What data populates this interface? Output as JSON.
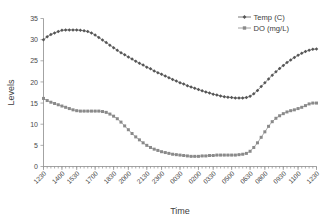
{
  "chart_data": {
    "type": "line",
    "title": "",
    "xlabel": "Time",
    "ylabel": "Levels",
    "ylim": [
      0,
      35
    ],
    "ytick_step": 5,
    "yticks": [
      0,
      5,
      10,
      15,
      20,
      25,
      30,
      35
    ],
    "grid": false,
    "legend_position": "top-right",
    "x_tick_labels": [
      "1230",
      "1400",
      "1530",
      "1700",
      "1830",
      "2000",
      "2130",
      "2300",
      "0030",
      "0200",
      "0330",
      "0500",
      "0630",
      "0800",
      "0930",
      "1100",
      "1230"
    ],
    "x_tick_interval_minutes": 90,
    "x_sample_interval_minutes": 15,
    "series": [
      {
        "name": "Temp (C)",
        "marker": "diamond",
        "color": "#555555",
        "values": [
          30.0,
          30.7,
          31.2,
          31.6,
          31.9,
          32.2,
          32.3,
          32.3,
          32.3,
          32.3,
          32.2,
          32.1,
          31.9,
          31.6,
          31.1,
          30.5,
          29.9,
          29.3,
          28.7,
          28.1,
          27.5,
          26.9,
          26.4,
          25.9,
          25.4,
          24.9,
          24.4,
          24.0,
          23.5,
          23.1,
          22.6,
          22.2,
          21.8,
          21.4,
          21.0,
          20.6,
          20.2,
          19.8,
          19.5,
          19.1,
          18.8,
          18.5,
          18.2,
          17.9,
          17.6,
          17.4,
          17.1,
          16.9,
          16.7,
          16.5,
          16.4,
          16.3,
          16.2,
          16.2,
          16.2,
          16.3,
          16.6,
          17.2,
          18.0,
          18.9,
          19.8,
          20.7,
          21.6,
          22.4,
          23.2,
          23.9,
          24.6,
          25.2,
          25.8,
          26.3,
          26.8,
          27.2,
          27.5,
          27.7,
          27.8
        ]
      },
      {
        "name": "DO (mg/L)",
        "marker": "square",
        "color": "#8a8a8a",
        "values": [
          16.1,
          15.6,
          15.2,
          14.9,
          14.6,
          14.3,
          14.0,
          13.7,
          13.4,
          13.2,
          13.1,
          13.1,
          13.1,
          13.1,
          13.1,
          13.1,
          13.0,
          12.8,
          12.4,
          11.9,
          11.3,
          10.5,
          9.6,
          8.7,
          7.8,
          7.0,
          6.3,
          5.6,
          5.0,
          4.5,
          4.1,
          3.8,
          3.5,
          3.3,
          3.1,
          2.9,
          2.8,
          2.7,
          2.6,
          2.5,
          2.4,
          2.4,
          2.4,
          2.5,
          2.5,
          2.6,
          2.6,
          2.7,
          2.7,
          2.7,
          2.7,
          2.7,
          2.7,
          2.8,
          2.9,
          3.1,
          3.6,
          4.5,
          5.6,
          6.9,
          8.2,
          9.5,
          10.6,
          11.4,
          12.0,
          12.5,
          12.9,
          13.2,
          13.4,
          13.7,
          14.0,
          14.4,
          14.8,
          15.0,
          15.0
        ]
      }
    ]
  }
}
